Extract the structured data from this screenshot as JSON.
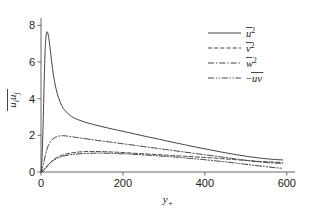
{
  "chart_data": {
    "type": "line",
    "title": "",
    "xlabel": "y+",
    "ylabel": "uiuj",
    "xlabel_base": "y",
    "xlabel_sub": "+",
    "ylabel_base": "u",
    "ylabel_sub1": "i",
    "ylabel_sub2": "j",
    "xlim": [
      0,
      620
    ],
    "ylim": [
      0,
      8.4
    ],
    "xticks": [
      0,
      200,
      400,
      600
    ],
    "xticklabels": [
      "0",
      "200",
      "400",
      "600"
    ],
    "yticks": [
      0,
      2,
      4,
      6,
      8
    ],
    "yticklabels": [
      "0",
      "2",
      "4",
      "6",
      "8"
    ],
    "grid": false,
    "legend_position": "upper-right",
    "legend_frame": false,
    "line_color": "#3a3a3a",
    "axis_color": "#555555",
    "background": "#ffffff",
    "series": [
      {
        "name": "u2",
        "label_base": "u",
        "label_sup": "2",
        "label_prefix": "",
        "linestyle": "solid",
        "dasharray": "",
        "peak_value": 7.65,
        "peak_x": 15,
        "end_value": 0.66,
        "x": [
          0,
          2,
          4,
          6,
          8,
          10,
          12,
          14,
          15,
          17,
          20,
          24,
          28,
          33,
          40,
          50,
          60,
          75,
          90,
          110,
          130,
          150,
          175,
          200,
          230,
          260,
          290,
          320,
          350,
          380,
          410,
          440,
          470,
          500,
          530,
          560,
          590
        ],
        "y": [
          0.0,
          0.55,
          1.7,
          3.3,
          5.1,
          6.6,
          7.35,
          7.62,
          7.65,
          7.55,
          7.15,
          6.4,
          5.65,
          4.95,
          4.25,
          3.65,
          3.32,
          3.02,
          2.86,
          2.7,
          2.58,
          2.47,
          2.34,
          2.22,
          2.07,
          1.92,
          1.78,
          1.63,
          1.49,
          1.35,
          1.22,
          1.09,
          0.97,
          0.86,
          0.77,
          0.7,
          0.66
        ]
      },
      {
        "name": "v2",
        "label_base": "v",
        "label_sup": "2",
        "label_prefix": "",
        "linestyle": "dashed",
        "dasharray": "4,2.2",
        "peak_value": 1.12,
        "peak_x": 110,
        "end_value": 0.52,
        "x": [
          0,
          5,
          10,
          15,
          20,
          28,
          36,
          46,
          58,
          72,
          88,
          105,
          125,
          150,
          175,
          200,
          230,
          260,
          290,
          320,
          350,
          380,
          410,
          440,
          470,
          500,
          530,
          560,
          590
        ],
        "y": [
          0.0,
          0.06,
          0.16,
          0.3,
          0.44,
          0.62,
          0.75,
          0.87,
          0.96,
          1.03,
          1.08,
          1.11,
          1.12,
          1.11,
          1.09,
          1.06,
          1.02,
          0.98,
          0.94,
          0.9,
          0.86,
          0.82,
          0.78,
          0.73,
          0.68,
          0.63,
          0.58,
          0.55,
          0.52
        ]
      },
      {
        "name": "w2",
        "label_base": "w",
        "label_sup": "2",
        "label_prefix": "",
        "linestyle": "dashdot",
        "dasharray": "6,2,1.3,2",
        "peak_value": 1.98,
        "peak_x": 52,
        "end_value": 0.47,
        "x": [
          0,
          3,
          6,
          10,
          14,
          18,
          23,
          28,
          34,
          40,
          46,
          52,
          60,
          70,
          85,
          100,
          120,
          145,
          170,
          200,
          230,
          260,
          290,
          320,
          350,
          380,
          410,
          440,
          470,
          500,
          530,
          560,
          590
        ],
        "y": [
          0.0,
          0.18,
          0.45,
          0.85,
          1.2,
          1.45,
          1.65,
          1.78,
          1.88,
          1.94,
          1.97,
          1.98,
          1.97,
          1.94,
          1.89,
          1.84,
          1.78,
          1.7,
          1.63,
          1.54,
          1.45,
          1.36,
          1.27,
          1.18,
          1.09,
          1.0,
          0.91,
          0.82,
          0.73,
          0.64,
          0.56,
          0.5,
          0.47
        ]
      },
      {
        "name": "-uv",
        "label_base": "uv",
        "label_sup": "",
        "label_prefix": "−",
        "linestyle": "dashdotdot",
        "dasharray": "6,1.8,1.2,1.8,1.2,1.8",
        "peak_value": 1.03,
        "peak_x": 135,
        "end_value": 0.2,
        "x": [
          0,
          5,
          10,
          16,
          22,
          30,
          40,
          52,
          66,
          82,
          100,
          120,
          140,
          165,
          190,
          215,
          245,
          275,
          305,
          335,
          365,
          395,
          425,
          455,
          485,
          515,
          545,
          570,
          590
        ],
        "y": [
          0.0,
          0.07,
          0.2,
          0.36,
          0.5,
          0.63,
          0.75,
          0.85,
          0.92,
          0.97,
          1.0,
          1.02,
          1.03,
          1.02,
          1.0,
          0.98,
          0.94,
          0.9,
          0.85,
          0.8,
          0.74,
          0.68,
          0.61,
          0.54,
          0.46,
          0.38,
          0.3,
          0.24,
          0.2
        ]
      }
    ]
  }
}
